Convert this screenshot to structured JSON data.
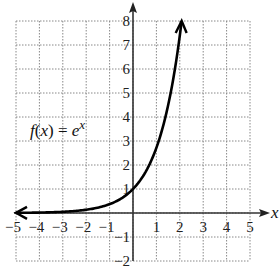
{
  "chart_data": {
    "type": "line",
    "title": "",
    "function_label": "f(x) = e^x",
    "function_label_parts": {
      "f": "f",
      "paren_open": "(",
      "x": "x",
      "paren_close": ")",
      "eq": " = ",
      "base": "e",
      "exp": "x"
    },
    "xlabel": "x",
    "ylabel": "",
    "xlim": [
      -5,
      5
    ],
    "ylim": [
      -2,
      8
    ],
    "grid": true,
    "grid_style": "dotted",
    "x_ticks": [
      -5,
      -4,
      -3,
      -2,
      -1,
      1,
      2,
      3,
      4,
      5
    ],
    "y_ticks": [
      8,
      7,
      6,
      5,
      4,
      3,
      2,
      1,
      -1,
      -2
    ],
    "x_tick_labels": [
      "−5",
      "−4",
      "−3",
      "−2",
      "−1",
      "1",
      "2",
      "3",
      "4",
      "5"
    ],
    "y_tick_labels": [
      "8",
      "7",
      "6",
      "5",
      "4",
      "3",
      "2",
      "1",
      "−1",
      "−2"
    ],
    "series": [
      {
        "name": "f(x) = e^x",
        "x": [
          -5,
          -4,
          -3,
          -2,
          -1,
          0,
          0.5,
          1,
          1.5,
          2.08
        ],
        "y": [
          0.007,
          0.018,
          0.05,
          0.135,
          0.368,
          1,
          1.65,
          2.72,
          4.48,
          8
        ],
        "arrows": [
          "left",
          "up"
        ]
      }
    ]
  }
}
